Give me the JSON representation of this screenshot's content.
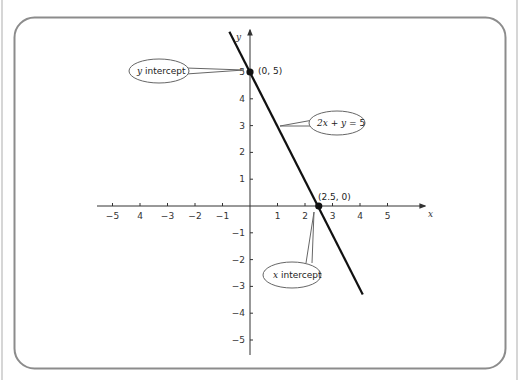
{
  "chart_data": {
    "type": "line",
    "title": "",
    "equation": "2x + y = 5",
    "xlabel": "x",
    "ylabel": "y",
    "xlim": [
      -5.5,
      6
    ],
    "ylim": [
      -5.5,
      6.5
    ],
    "grid": false,
    "x_ticks": [
      -5,
      -4,
      -3,
      -2,
      -1,
      1,
      2,
      3,
      4,
      5
    ],
    "x_tick_labels": [
      "−5",
      "4",
      "−3",
      "−2",
      "−1",
      "1",
      "2",
      "3",
      "4",
      "5"
    ],
    "y_ticks": [
      5,
      4,
      3,
      2,
      1,
      -1,
      -2,
      -3,
      -4,
      -5
    ],
    "y_tick_labels": [
      "5",
      "4",
      "3",
      "2",
      "1",
      "−1",
      "−2",
      "−3",
      "−4",
      "−5"
    ],
    "series": [
      {
        "name": "2x + y = 5",
        "x": [
          -0.75,
          4.1
        ],
        "y": [
          6.5,
          -3.3
        ]
      }
    ],
    "points": [
      {
        "x": 0,
        "y": 5,
        "label": "(0, 5)"
      },
      {
        "x": 2.5,
        "y": 0,
        "label": "(2.5, 0)"
      }
    ],
    "annotations": [
      {
        "text_italic": "y",
        "text": " intercept",
        "target": "(0, 5)"
      },
      {
        "text_italic": "x",
        "text": " intercept",
        "target": "(2.5, 0)"
      },
      {
        "text": "2x + y = 5",
        "target": "line"
      }
    ]
  },
  "labels": {
    "x_axis": "x",
    "y_axis": "y",
    "point_y_intercept": "(0, 5)",
    "point_x_intercept": "(2.5, 0)",
    "callout_y_intercept_var": "y",
    "callout_y_intercept_text": " intercept",
    "callout_x_intercept_var": "x",
    "callout_x_intercept_text": " intercept",
    "callout_eq_2x": "2x",
    "callout_eq_rest": " + ",
    "callout_eq_y": "y",
    "callout_eq_end": " = 5"
  },
  "colors": {
    "frame": "#8c8c8c",
    "axis": "#333333",
    "line": "#111111",
    "callout_stroke": "#666666"
  }
}
